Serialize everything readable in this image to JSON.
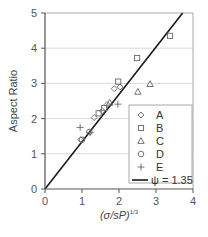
{
  "chart_data": {
    "type": "scatter",
    "title": "",
    "xlabel": "(σ/sP)^1/3",
    "xlabel_main": "(σ/sP)",
    "xlabel_sup": "1/3",
    "ylabel": "Aspect Ratio",
    "xlim": [
      0,
      4
    ],
    "ylim": [
      0,
      5
    ],
    "xticks": [
      "0",
      "1",
      "2",
      "3",
      "4"
    ],
    "yticks": [
      "0",
      "1",
      "2",
      "3",
      "4",
      "5"
    ],
    "grid": "horizontal",
    "legend_position": "lower right",
    "series": [
      {
        "name": "A",
        "marker": "diamond",
        "points": [
          [
            0.97,
            1.4
          ],
          [
            1.33,
            2.03
          ],
          [
            1.55,
            2.22
          ],
          [
            1.68,
            2.4
          ],
          [
            1.87,
            2.85
          ],
          [
            2.03,
            2.9
          ]
        ]
      },
      {
        "name": "B",
        "marker": "square",
        "points": [
          [
            1.45,
            2.15
          ],
          [
            1.6,
            2.3
          ],
          [
            1.98,
            3.05
          ],
          [
            2.49,
            3.72
          ],
          [
            3.38,
            4.35
          ]
        ]
      },
      {
        "name": "C",
        "marker": "triangle",
        "points": [
          [
            1.75,
            2.45
          ],
          [
            2.51,
            2.76
          ],
          [
            2.84,
            2.98
          ]
        ]
      },
      {
        "name": "D",
        "marker": "circle",
        "points": [
          [
            1.0,
            1.4
          ],
          [
            1.2,
            1.62
          ]
        ]
      },
      {
        "name": "E",
        "marker": "plus",
        "points": [
          [
            0.95,
            1.75
          ],
          [
            1.22,
            1.6
          ],
          [
            1.97,
            2.41
          ]
        ]
      }
    ],
    "fit_line": {
      "name": "ψ = 1.35",
      "slope": 1.35,
      "x_range": [
        0,
        3.72
      ]
    }
  },
  "legend": {
    "items": [
      {
        "label": "A",
        "marker": "diamond"
      },
      {
        "label": "B",
        "marker": "square"
      },
      {
        "label": "C",
        "marker": "triangle"
      },
      {
        "label": "D",
        "marker": "circle"
      },
      {
        "label": "E",
        "marker": "plus"
      }
    ],
    "line_label": "ψ = 1.35"
  },
  "colors": {
    "axis": "#555555",
    "grid": "#d9d9d9",
    "line": "#1a1a1a",
    "marker": "#666666",
    "frame": "#aaaaaa"
  }
}
